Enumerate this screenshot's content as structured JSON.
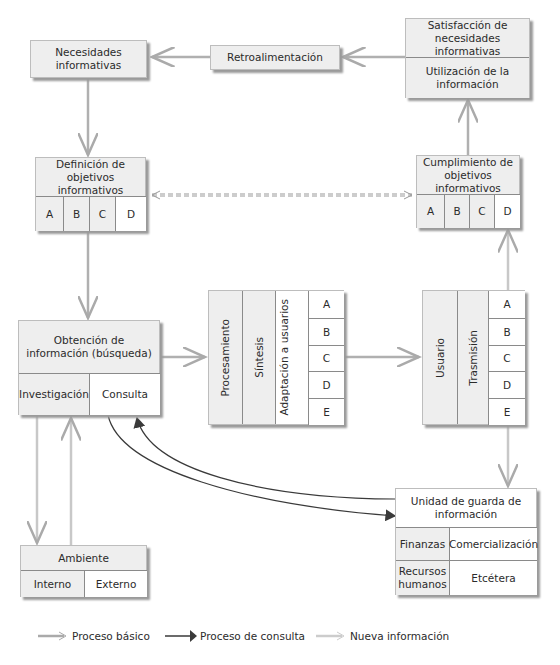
{
  "nodes": {
    "necesidades": {
      "label": "Necesidades informativas"
    },
    "retroalimentacion": {
      "label": "Retroalimentación"
    },
    "satisfaccion": {
      "top": "Satisfacción de necesidades informativas",
      "bottom": "Utilización de la información"
    },
    "definicion": {
      "title": "Definición de objetivos informativos",
      "cells": [
        "A",
        "B",
        "C",
        "D"
      ]
    },
    "cumplimiento": {
      "title": "Cumplimiento de objetivos informativos",
      "cells": [
        "A",
        "B",
        "C",
        "D"
      ]
    },
    "obtencion": {
      "title": "Obtención de información (búsqueda)",
      "left": "Investigación",
      "right": "Consulta"
    },
    "procesamiento": {
      "columns": [
        "Procesamiento",
        "Síntesis",
        "Adaptación a usuarios"
      ],
      "cells": [
        "A",
        "B",
        "C",
        "D",
        "E"
      ]
    },
    "usuario": {
      "columns": [
        "Usuario",
        "Trasmisión"
      ],
      "cells": [
        "A",
        "B",
        "C",
        "D",
        "E"
      ]
    },
    "unidad": {
      "title": "Unidad de guarda de información",
      "cells": [
        "Finanzas",
        "Comercialización",
        "Recursos humanos",
        "Etcétera"
      ]
    },
    "ambiente": {
      "title": "Ambiente",
      "left": "Interno",
      "right": "Externo"
    }
  },
  "legend": [
    {
      "label": "Proceso básico",
      "style": "grey-hollow-arrow"
    },
    {
      "label": "Proceso de consulta",
      "style": "dark-solid-arrow"
    },
    {
      "label": "Nueva información",
      "style": "light-hollow-arrow"
    }
  ],
  "colors": {
    "basic": "#a8a8a8",
    "consult": "#3a3a3a",
    "new_info": "#c8c8c8",
    "box_shade": "#eeeeee",
    "border": "#8a8a8a"
  }
}
